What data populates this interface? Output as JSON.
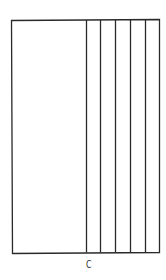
{
  "diagram": {
    "type": "partitioned-rectangle",
    "stroke_color": "#2a2a2a",
    "background": "#ffffff",
    "outer_rect": {
      "x1": 11,
      "y1": 20,
      "x2": 159,
      "y2": 253
    },
    "divider_lines_x": [
      86,
      100,
      115,
      130,
      145
    ],
    "labels": [
      {
        "text": "C",
        "x": 86,
        "y": 259
      }
    ]
  }
}
